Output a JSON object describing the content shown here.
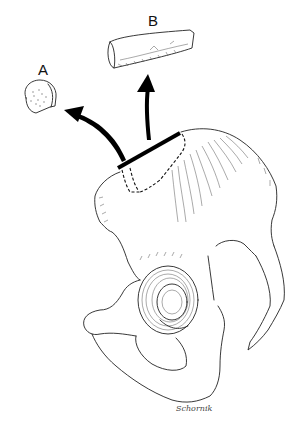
{
  "figure": {
    "labels": {
      "a": "A",
      "b": "B"
    },
    "signature": "Schornik",
    "colors": {
      "background": "#ffffff",
      "line": "#222222",
      "cut_bar": "#000000"
    },
    "parts": [
      {
        "id": "graft-a",
        "label": "A",
        "description": "Small round corticocancellous plug"
      },
      {
        "id": "graft-b",
        "label": "B",
        "description": "Cylindrical tricortical strip graft"
      },
      {
        "id": "cut-line",
        "description": "Thick bar marking osteotomy along iliac crest"
      },
      {
        "id": "arrow-a",
        "description": "Curved arrow from crest to graft A"
      },
      {
        "id": "arrow-b",
        "description": "Arrow from crest up to graft B"
      },
      {
        "id": "pelvis",
        "description": "Hemipelvis with iliac wing, acetabulum, obturator foramen"
      }
    ]
  }
}
